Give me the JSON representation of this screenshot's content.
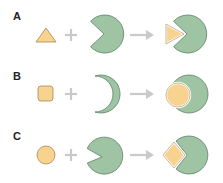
{
  "colors": {
    "green_fill": "#9ec4a3",
    "green_stroke": "#5f7f66",
    "yellow_fill": "#f8d28f",
    "yellow_stroke": "#a68850",
    "operator": "#c9c9c9"
  },
  "panels": [
    {
      "label": "A",
      "ligand": "triangle",
      "receptor": "pacman-wedge",
      "result": "triangle-in-wedge"
    },
    {
      "label": "B",
      "ligand": "rounded-square",
      "receptor": "crescent",
      "result": "circle-in-crescent"
    },
    {
      "label": "C",
      "ligand": "circle",
      "receptor": "pacman-narrow",
      "result": "diamond-in-wedge"
    }
  ],
  "operators": {
    "plus": "+",
    "arrow": "→"
  }
}
